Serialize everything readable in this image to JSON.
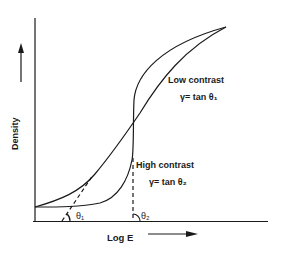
{
  "diagram": {
    "axes": {
      "y_label": "Density",
      "x_label": "Log E"
    },
    "curves": [
      {
        "name": "Low contrast",
        "gamma_formula": "γ= tan θ₁",
        "angle_label": "θ₁"
      },
      {
        "name": "High contrast",
        "gamma_formula": "γ= tan θ₂",
        "angle_label": "θ₂"
      }
    ],
    "colors": {
      "line": "#1a1a1a",
      "background": "#ffffff"
    }
  }
}
